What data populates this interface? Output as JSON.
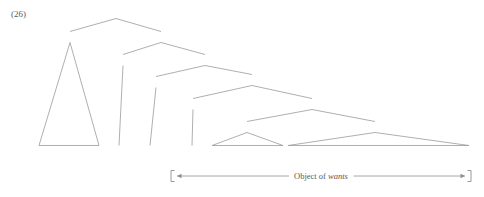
{
  "figure": {
    "example_number": "(26)",
    "background_color": "#ffffff",
    "line_color": "#9a9a9a",
    "text_color": "#5a5a5a"
  },
  "tree": {
    "nodes": [
      {
        "id": "S_top",
        "label": "S",
        "x": 116,
        "y": 15
      },
      {
        "id": "DP_1",
        "label": "DP",
        "x": 70,
        "y": 39
      },
      {
        "id": "IP",
        "label": "IP",
        "x": 161,
        "y": 39
      },
      {
        "id": "INFL",
        "label": "INFL",
        "x": 123,
        "y": 62
      },
      {
        "id": "VP_1",
        "label": "VP",
        "x": 205,
        "y": 62
      },
      {
        "id": "V",
        "label": "V",
        "x": 156,
        "y": 84
      },
      {
        "id": "CP",
        "label": "CP",
        "x": 252,
        "y": 82
      },
      {
        "id": "COMP",
        "label": "COMP",
        "x": 193,
        "y": 106
      },
      {
        "id": "S_low",
        "label": "S",
        "x": 312,
        "y": 106
      },
      {
        "id": "DP_2",
        "label": "DP",
        "x": 247,
        "y": 129
      },
      {
        "id": "VP_2",
        "label": "VP",
        "x": 375,
        "y": 129
      }
    ],
    "terminals": [
      {
        "id": "t_lord_oberon",
        "label": "Lord Oberon",
        "x": 68,
        "y": 154
      },
      {
        "id": "t_infl_zero",
        "label": "0",
        "x": 119,
        "y": 154
      },
      {
        "id": "t_wants",
        "label": "wants",
        "x": 150,
        "y": 154
      },
      {
        "id": "t_comp_zero",
        "label": "0",
        "x": 192,
        "y": 154
      },
      {
        "id": "t_lord_oberon2",
        "label": "(Lord Oberon)",
        "x": 247,
        "y": 154
      },
      {
        "id": "t_vp_string",
        "label": "to tread on the Duke of Wimple's toe",
        "x": 377,
        "y": 154
      }
    ],
    "branches": [
      {
        "from": "S_top",
        "to": "DP_1"
      },
      {
        "from": "S_top",
        "to": "IP"
      },
      {
        "from": "IP",
        "to": "INFL"
      },
      {
        "from": "IP",
        "to": "VP_1"
      },
      {
        "from": "VP_1",
        "to": "V"
      },
      {
        "from": "VP_1",
        "to": "CP"
      },
      {
        "from": "CP",
        "to": "COMP"
      },
      {
        "from": "CP",
        "to": "S_low"
      },
      {
        "from": "S_low",
        "to": "DP_2"
      },
      {
        "from": "S_low",
        "to": "VP_2"
      }
    ],
    "stems": [
      {
        "from": "INFL",
        "to": "t_infl_zero"
      },
      {
        "from": "V",
        "to": "t_wants"
      },
      {
        "from": "COMP",
        "to": "t_comp_zero"
      }
    ],
    "triangles": [
      {
        "apex": "DP_1",
        "terminal": "t_lord_oberon",
        "left": 39,
        "right": 99
      },
      {
        "apex": "DP_2",
        "terminal": "t_lord_oberon2",
        "left": 212,
        "right": 283
      },
      {
        "apex": "VP_2",
        "terminal": "t_vp_string",
        "left": 288,
        "right": 469
      }
    ]
  },
  "annotation": {
    "label_prefix": "Object of ",
    "label_italic": "wants",
    "full_label": "Object of wants",
    "left_x": 171,
    "right_x": 471,
    "y": 176,
    "bracket_height": 11
  }
}
